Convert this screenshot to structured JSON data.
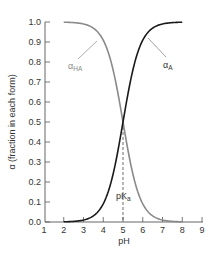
{
  "chart_data": {
    "type": "line",
    "title": "",
    "xlabel": "pH",
    "ylabel": "α (fraction in each form)",
    "xlim": [
      1,
      9
    ],
    "ylim": [
      0.0,
      1.0
    ],
    "x_ticks": [
      1,
      2,
      3,
      4,
      5,
      6,
      7,
      8,
      9
    ],
    "y_ticks": [
      "0.0",
      "0.1",
      "0.2",
      "0.3",
      "0.4",
      "0.5",
      "0.6",
      "0.7",
      "0.8",
      "0.9",
      "1.0"
    ],
    "grid": false,
    "legend": "none (inline annotations)",
    "x": [
      2.0,
      2.5,
      3.0,
      3.5,
      4.0,
      4.5,
      5.0,
      5.5,
      6.0,
      6.5,
      7.0,
      7.5,
      8.0
    ],
    "series": [
      {
        "name": "α_HA",
        "label_main": "α",
        "label_sub": "HA",
        "color": "#8a8a8a",
        "values": [
          0.999,
          0.997,
          0.99,
          0.969,
          0.909,
          0.76,
          0.5,
          0.24,
          0.091,
          0.031,
          0.01,
          0.003,
          0.001
        ]
      },
      {
        "name": "α_A",
        "label_main": "α",
        "label_sub": "A",
        "color": "#1a1a1a",
        "values": [
          0.001,
          0.003,
          0.01,
          0.031,
          0.091,
          0.24,
          0.5,
          0.76,
          0.909,
          0.969,
          0.99,
          0.997,
          0.999
        ]
      }
    ],
    "annotations": [
      {
        "text_main": "pK",
        "text_sub": "a",
        "x": 5,
        "y": 0.5,
        "note": "dashed vertical line from crossing point (pH 5, α 0.5) to x-axis"
      }
    ],
    "pKa": 5
  }
}
